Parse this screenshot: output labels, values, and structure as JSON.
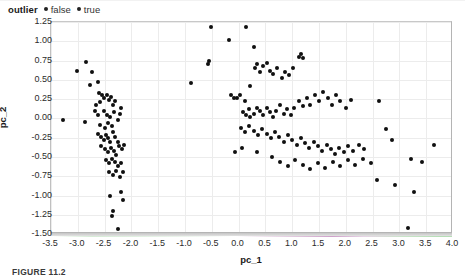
{
  "legend": {
    "title": "outlier",
    "entries": [
      {
        "label": "false",
        "color": "#101010",
        "marker": "legend-dot-false"
      },
      {
        "label": "true",
        "color": "#101010",
        "marker": "legend-dot-true"
      }
    ]
  },
  "caption": "FIGURE 11.2",
  "chart_data": {
    "type": "scatter",
    "title": "",
    "xlabel": "pc_1",
    "ylabel": "pc_2",
    "xlim": [
      -3.5,
      4.0
    ],
    "ylim": [
      -1.5,
      1.25
    ],
    "xticks": [
      -3.5,
      -3.0,
      -2.5,
      -2.0,
      -1.5,
      -1.0,
      -0.5,
      0.0,
      0.5,
      1.0,
      1.5,
      2.0,
      2.5,
      3.0,
      3.5,
      4.0
    ],
    "xtick_labels": [
      "-3.5",
      "-3.0",
      "-2.5",
      "-2.0",
      "-1.5",
      "-1.0",
      "-0.5",
      "0.0",
      "0.5",
      "1.0",
      "1.5",
      "2.0",
      "2.5",
      "3.0",
      "3.5",
      "4.0"
    ],
    "yticks": [
      1.25,
      1.0,
      0.75,
      0.5,
      0.25,
      0.0,
      -0.25,
      -0.5,
      -0.75,
      -1.0,
      -1.25,
      -1.5
    ],
    "ytick_labels": [
      "1.25",
      "1.00",
      "0.75",
      "0.50",
      "0.25",
      "0.00",
      "-0.25",
      "-0.50",
      "-0.75",
      "-1.00",
      "-1.25",
      "-1.50"
    ],
    "grid": true,
    "legend_position": "above-left",
    "marker_color": "#101010",
    "marker_size": 4,
    "series": [
      {
        "name": "false",
        "points": [
          [
            -3.02,
            0.62
          ],
          [
            -2.84,
            0.73
          ],
          [
            -2.74,
            0.6
          ],
          [
            -2.78,
            0.43
          ],
          [
            -2.62,
            0.47
          ],
          [
            -2.6,
            0.33
          ],
          [
            -2.55,
            0.3
          ],
          [
            -2.52,
            0.26
          ],
          [
            -2.58,
            0.21
          ],
          [
            -2.66,
            0.17
          ],
          [
            -2.46,
            0.31
          ],
          [
            -2.42,
            0.24
          ],
          [
            -2.38,
            0.28
          ],
          [
            -2.34,
            0.18
          ],
          [
            -2.3,
            0.22
          ],
          [
            -2.68,
            0.09
          ],
          [
            -2.62,
            0.04
          ],
          [
            -2.52,
            0.1
          ],
          [
            -2.46,
            0.05
          ],
          [
            -2.4,
            0.02
          ],
          [
            -2.33,
            0.08
          ],
          [
            -3.28,
            -0.02
          ],
          [
            -2.86,
            -0.05
          ],
          [
            -2.58,
            -0.08
          ],
          [
            -2.5,
            -0.12
          ],
          [
            -2.44,
            -0.06
          ],
          [
            -2.36,
            -0.1
          ],
          [
            -2.26,
            -0.02
          ],
          [
            -2.22,
            0.06
          ],
          [
            -2.2,
            0.14
          ],
          [
            -2.62,
            -0.2
          ],
          [
            -2.56,
            -0.24
          ],
          [
            -2.52,
            -0.28
          ],
          [
            -2.48,
            -0.22
          ],
          [
            -2.44,
            -0.26
          ],
          [
            -2.4,
            -0.3
          ],
          [
            -2.34,
            -0.18
          ],
          [
            -2.3,
            -0.24
          ],
          [
            -2.26,
            -0.31
          ],
          [
            -2.56,
            -0.36
          ],
          [
            -2.5,
            -0.4
          ],
          [
            -2.44,
            -0.44
          ],
          [
            -2.38,
            -0.38
          ],
          [
            -2.33,
            -0.42
          ],
          [
            -2.28,
            -0.47
          ],
          [
            -2.24,
            -0.36
          ],
          [
            -2.18,
            -0.4
          ],
          [
            -2.14,
            -0.34
          ],
          [
            -2.48,
            -0.54
          ],
          [
            -2.42,
            -0.58
          ],
          [
            -2.36,
            -0.52
          ],
          [
            -2.3,
            -0.56
          ],
          [
            -2.26,
            -0.62
          ],
          [
            -2.2,
            -0.58
          ],
          [
            -2.42,
            -0.7
          ],
          [
            -2.34,
            -0.74
          ],
          [
            -2.28,
            -0.68
          ],
          [
            -2.22,
            -0.76
          ],
          [
            -2.16,
            -0.7
          ],
          [
            -0.52,
            1.18
          ],
          [
            -0.56,
            0.74
          ],
          [
            -0.58,
            0.7
          ],
          [
            -0.88,
            0.46
          ],
          [
            -0.18,
            1.02
          ],
          [
            -0.14,
            0.3
          ],
          [
            -0.08,
            0.27
          ],
          [
            -0.04,
            0.26
          ],
          [
            0.02,
            0.3
          ],
          [
            0.12,
            0.22
          ],
          [
            0.22,
            0.42
          ],
          [
            0.3,
            0.66
          ],
          [
            0.34,
            0.7
          ],
          [
            0.4,
            0.6
          ],
          [
            0.46,
            0.68
          ],
          [
            0.52,
            0.72
          ],
          [
            0.58,
            0.62
          ],
          [
            0.64,
            0.58
          ],
          [
            0.72,
            0.66
          ],
          [
            0.8,
            0.52
          ],
          [
            0.86,
            0.6
          ],
          [
            0.94,
            0.56
          ],
          [
            1.02,
            0.66
          ],
          [
            1.12,
            0.8
          ],
          [
            1.16,
            0.84
          ],
          [
            1.2,
            0.78
          ],
          [
            0.14,
            1.18
          ],
          [
            0.28,
            0.92
          ],
          [
            0.08,
            0.08
          ],
          [
            0.14,
            0.04
          ],
          [
            0.2,
            0.12
          ],
          [
            0.22,
            0.02
          ],
          [
            0.28,
            0.06
          ],
          [
            0.34,
            0.14
          ],
          [
            0.4,
            0.1
          ],
          [
            0.46,
            0.04
          ],
          [
            0.52,
            0.14
          ],
          [
            0.58,
            0.08
          ],
          [
            0.64,
            0.02
          ],
          [
            0.7,
            0.1
          ],
          [
            0.78,
            0.18
          ],
          [
            0.84,
            0.06
          ],
          [
            0.9,
            0.12
          ],
          [
            0.98,
            0.04
          ],
          [
            1.04,
            0.14
          ],
          [
            1.12,
            0.22
          ],
          [
            1.2,
            0.16
          ],
          [
            1.28,
            0.26
          ],
          [
            1.34,
            0.18
          ],
          [
            1.42,
            0.3
          ],
          [
            1.5,
            0.22
          ],
          [
            1.58,
            0.34
          ],
          [
            1.66,
            0.26
          ],
          [
            1.74,
            0.18
          ],
          [
            1.82,
            0.3
          ],
          [
            1.9,
            0.22
          ],
          [
            2.0,
            0.14
          ],
          [
            2.1,
            0.24
          ],
          [
            0.04,
            -0.12
          ],
          [
            0.12,
            -0.18
          ],
          [
            0.2,
            -0.1
          ],
          [
            0.28,
            -0.16
          ],
          [
            0.36,
            -0.22
          ],
          [
            0.44,
            -0.14
          ],
          [
            0.52,
            -0.2
          ],
          [
            0.6,
            -0.26
          ],
          [
            0.68,
            -0.18
          ],
          [
            0.76,
            -0.24
          ],
          [
            0.84,
            -0.3
          ],
          [
            0.92,
            -0.22
          ],
          [
            1.0,
            -0.28
          ],
          [
            1.08,
            -0.34
          ],
          [
            1.16,
            -0.26
          ],
          [
            1.24,
            -0.32
          ],
          [
            1.32,
            -0.38
          ],
          [
            1.4,
            -0.3
          ],
          [
            1.48,
            -0.36
          ],
          [
            1.56,
            -0.42
          ],
          [
            1.64,
            -0.34
          ],
          [
            1.72,
            -0.4
          ],
          [
            1.8,
            -0.46
          ],
          [
            1.88,
            -0.38
          ],
          [
            1.96,
            -0.44
          ],
          [
            2.04,
            -0.36
          ],
          [
            2.14,
            -0.42
          ],
          [
            2.24,
            -0.34
          ],
          [
            2.34,
            -0.4
          ],
          [
            0.62,
            -0.5
          ],
          [
            0.78,
            -0.56
          ],
          [
            0.92,
            -0.62
          ],
          [
            1.06,
            -0.54
          ],
          [
            1.2,
            -0.6
          ],
          [
            1.34,
            -0.66
          ],
          [
            1.48,
            -0.58
          ],
          [
            1.62,
            -0.64
          ],
          [
            1.76,
            -0.56
          ],
          [
            1.9,
            -0.62
          ],
          [
            2.04,
            -0.54
          ],
          [
            2.18,
            -0.6
          ],
          [
            2.32,
            -0.52
          ],
          [
            2.46,
            -0.58
          ],
          [
            -0.06,
            -0.44
          ],
          [
            0.06,
            -0.38
          ],
          [
            0.34,
            -0.44
          ],
          [
            2.62,
            0.22
          ],
          [
            2.74,
            -0.14
          ],
          [
            2.86,
            -0.28
          ]
        ]
      },
      {
        "name": "true",
        "points": [
          [
            -2.4,
            -1.0
          ],
          [
            -2.2,
            -0.96
          ],
          [
            -2.16,
            -1.06
          ],
          [
            -2.34,
            -1.2
          ],
          [
            -2.36,
            -1.26
          ],
          [
            -2.26,
            -1.44
          ],
          [
            3.64,
            -0.34
          ],
          [
            3.22,
            -0.52
          ],
          [
            3.42,
            -0.56
          ],
          [
            3.28,
            -0.96
          ],
          [
            3.16,
            -1.42
          ],
          [
            2.92,
            -0.86
          ],
          [
            2.58,
            -0.8
          ]
        ]
      }
    ]
  }
}
